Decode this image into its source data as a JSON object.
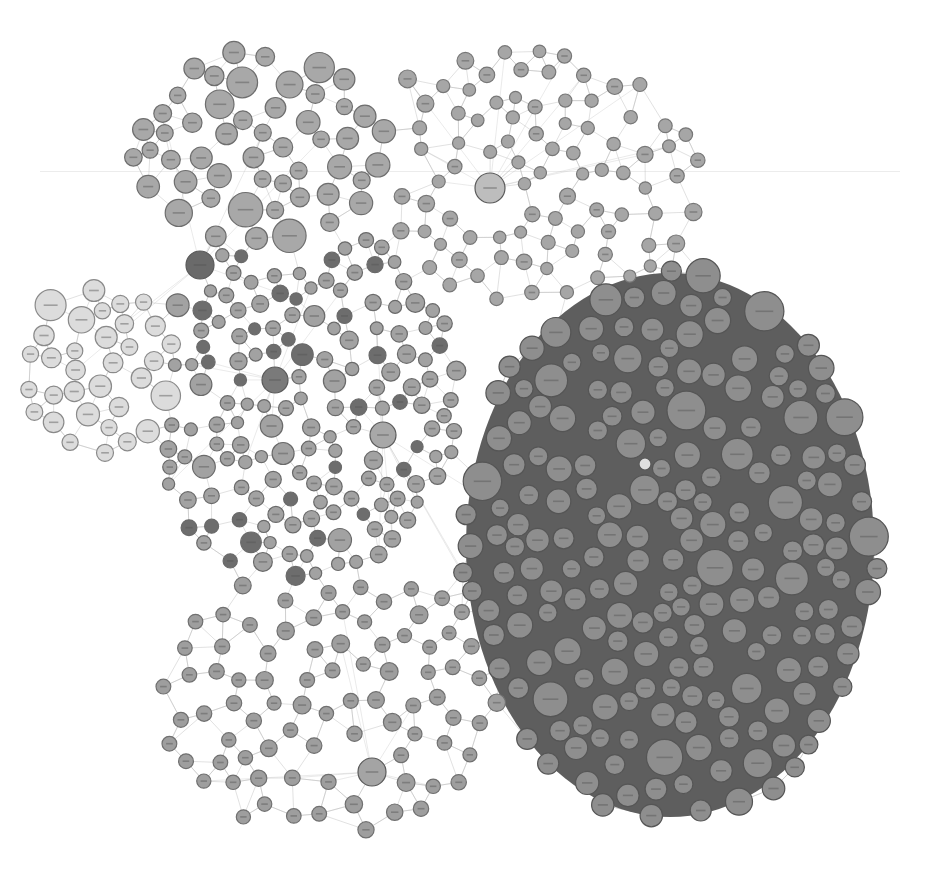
{
  "diagram": {
    "type": "network-graph",
    "background": "#ffffff",
    "edge_color": "#b8b8b8",
    "clusters": [
      {
        "name": "top-left-cluster",
        "cx": 260,
        "cy": 150,
        "rx": 130,
        "ry": 100,
        "fill": "#a8a8a8",
        "stroke": "#6e6e6e",
        "density": "dense",
        "node_r": [
          8,
          18
        ]
      },
      {
        "name": "left-light-cluster",
        "cx": 100,
        "cy": 370,
        "rx": 75,
        "ry": 90,
        "fill": "#dcdcdc",
        "stroke": "#8a8a8a",
        "density": "dense",
        "node_r": [
          8,
          17
        ]
      },
      {
        "name": "central-mixed-cluster",
        "cx": 300,
        "cy": 400,
        "rx": 160,
        "ry": 180,
        "fill": "#a2a2a2",
        "stroke": "#6a6a6a",
        "density": "medium",
        "node_r": [
          6,
          12
        ],
        "dark_fill": "#6d6d6d"
      },
      {
        "name": "top-sparse-region",
        "cx": 520,
        "cy": 180,
        "rx": 180,
        "ry": 130,
        "fill": "#a6a6a6",
        "stroke": "#777777",
        "density": "sparse",
        "node_r": [
          6,
          9
        ]
      },
      {
        "name": "bottom-sparse-region",
        "cx": 330,
        "cy": 700,
        "rx": 170,
        "ry": 140,
        "fill": "#9e9e9e",
        "stroke": "#707070",
        "density": "sparse",
        "node_r": [
          7,
          9
        ]
      },
      {
        "name": "right-dense-cluster",
        "cx": 670,
        "cy": 545,
        "rx": 210,
        "ry": 280,
        "fill": "#8e8e8e",
        "stroke": "#555555",
        "density": "packed",
        "node_r": [
          9,
          20
        ],
        "bg": "#5e5e5e"
      }
    ],
    "hubs": [
      {
        "x": 200,
        "y": 265,
        "r": 14,
        "fill": "#6a6a6a"
      },
      {
        "x": 383,
        "y": 435,
        "r": 13,
        "fill": "#a8a8a8"
      },
      {
        "x": 372,
        "y": 772,
        "r": 14,
        "fill": "#a4a4a4"
      },
      {
        "x": 490,
        "y": 188,
        "r": 15,
        "fill": "#bdbdbd"
      },
      {
        "x": 275,
        "y": 380,
        "r": 13,
        "fill": "#7a7a7a"
      },
      {
        "x": 645,
        "y": 464,
        "r": 6,
        "fill": "#e0e0e0"
      }
    ],
    "labels_legible": false
  }
}
